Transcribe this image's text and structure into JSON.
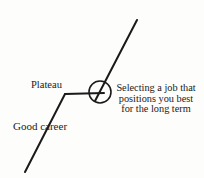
{
  "diagram": {
    "background_color": "#fdfdfc",
    "stroke_color": "#1a1a1a",
    "labels": {
      "plateau": "Plateau",
      "good_career": "Good career"
    },
    "annotation": {
      "line1": "Selecting a job that",
      "line2": "positions you best",
      "line3": "for the long term"
    },
    "marker": {
      "name": "circle-highlight",
      "center_x": 100,
      "center_y": 92,
      "radius": 11
    },
    "paths": {
      "rising_lower": "M25,172 L65,94",
      "plateau_flat": "M65,94 L104,93",
      "rising_upper": "M96,100 L137,20"
    }
  }
}
